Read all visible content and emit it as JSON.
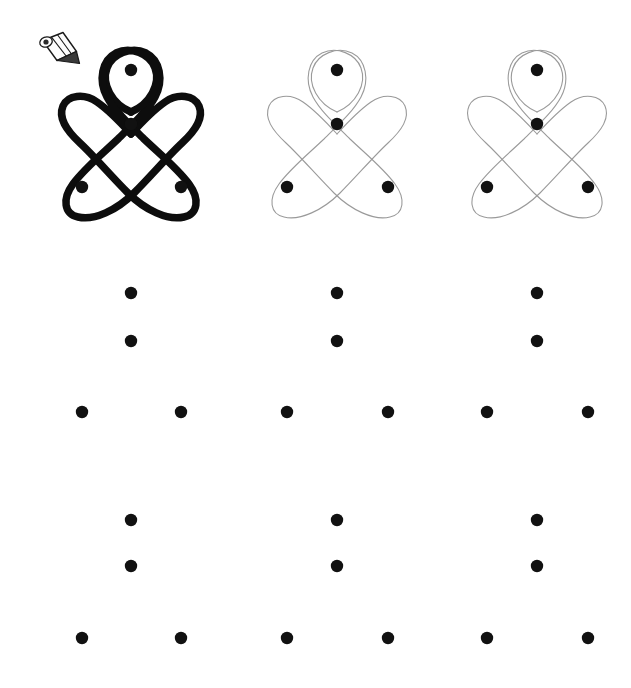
{
  "page": {
    "title": "Kolam dot-grid tracing worksheet",
    "background_color": "#ffffff",
    "width": 631,
    "height": 688
  },
  "icons": {
    "pencil": {
      "name": "pencil-icon",
      "x": 38,
      "y": 32,
      "width": 44,
      "height": 34,
      "color": "#1a1a1a"
    }
  },
  "colors": {
    "dot": "#111111",
    "stroke_bold": "#0d0d0d",
    "stroke_trace": "#9a9a9a"
  },
  "geometry": {
    "dot_radius": 6.2,
    "columns_x": [
      82,
      131,
      181,
      287,
      337,
      388,
      487,
      537,
      588
    ],
    "rows_y": [
      70,
      124,
      187,
      293,
      341,
      412,
      520,
      566,
      638
    ]
  },
  "chart_data": {
    "type": "scatter",
    "title": "Kolam dot-grid tracing worksheet",
    "xlabel": "",
    "ylabel": "",
    "xlim": [
      0,
      631
    ],
    "ylim": [
      688,
      0
    ],
    "grid": false,
    "legend": null,
    "series": [
      {
        "name": "group-1-dots",
        "values": [
          [
            131,
            70
          ],
          [
            131,
            124
          ],
          [
            82,
            187
          ],
          [
            181,
            187
          ]
        ]
      },
      {
        "name": "group-2-dots",
        "values": [
          [
            337,
            70
          ],
          [
            337,
            124
          ],
          [
            287,
            187
          ],
          [
            388,
            187
          ]
        ]
      },
      {
        "name": "group-3-dots",
        "values": [
          [
            537,
            70
          ],
          [
            537,
            124
          ],
          [
            487,
            187
          ],
          [
            588,
            187
          ]
        ]
      },
      {
        "name": "group-4-dots",
        "values": [
          [
            131,
            293
          ],
          [
            131,
            341
          ],
          [
            82,
            412
          ],
          [
            181,
            412
          ]
        ]
      },
      {
        "name": "group-5-dots",
        "values": [
          [
            337,
            293
          ],
          [
            337,
            341
          ],
          [
            287,
            412
          ],
          [
            388,
            412
          ]
        ]
      },
      {
        "name": "group-6-dots",
        "values": [
          [
            537,
            293
          ],
          [
            537,
            341
          ],
          [
            487,
            412
          ],
          [
            588,
            412
          ]
        ]
      },
      {
        "name": "group-7-dots",
        "values": [
          [
            131,
            520
          ],
          [
            131,
            566
          ],
          [
            82,
            638
          ],
          [
            181,
            638
          ]
        ]
      },
      {
        "name": "group-8-dots",
        "values": [
          [
            337,
            520
          ],
          [
            337,
            566
          ],
          [
            287,
            638
          ],
          [
            388,
            638
          ]
        ]
      },
      {
        "name": "group-9-dots",
        "values": [
          [
            537,
            520
          ],
          [
            537,
            566
          ],
          [
            487,
            638
          ],
          [
            588,
            638
          ]
        ]
      }
    ]
  },
  "figures": [
    {
      "id": "figure-1",
      "label": "Bold kolam example",
      "style": "bold",
      "stroke_color": "#0d0d0d",
      "stroke_width": 7.5,
      "origin_x": 0,
      "origin_y": 0,
      "has_curve": true
    },
    {
      "id": "figure-2",
      "label": "Light kolam trace",
      "style": "trace",
      "stroke_color": "#9a9a9a",
      "stroke_width": 1.1,
      "origin_x": 206,
      "origin_y": 0,
      "has_curve": true
    },
    {
      "id": "figure-3",
      "label": "Light kolam trace",
      "style": "trace",
      "stroke_color": "#9a9a9a",
      "stroke_width": 1.1,
      "origin_x": 406,
      "origin_y": 0,
      "has_curve": true
    },
    {
      "id": "figure-4",
      "label": "Blank practice dot grid",
      "style": "blank",
      "stroke_color": null,
      "stroke_width": 0,
      "origin_x": 0,
      "origin_y": 224,
      "has_curve": false
    },
    {
      "id": "figure-5",
      "label": "Blank practice dot grid",
      "style": "blank",
      "stroke_color": null,
      "stroke_width": 0,
      "origin_x": 206,
      "origin_y": 224,
      "has_curve": false
    },
    {
      "id": "figure-6",
      "label": "Blank practice dot grid",
      "style": "blank",
      "stroke_color": null,
      "stroke_width": 0,
      "origin_x": 406,
      "origin_y": 224,
      "has_curve": false
    },
    {
      "id": "figure-7",
      "label": "Blank practice dot grid",
      "style": "blank",
      "stroke_color": null,
      "stroke_width": 0,
      "origin_x": 0,
      "origin_y": 450,
      "has_curve": false
    },
    {
      "id": "figure-8",
      "label": "Blank practice dot grid",
      "style": "blank",
      "stroke_color": null,
      "stroke_width": 0,
      "origin_x": 206,
      "origin_y": 450,
      "has_curve": false
    },
    {
      "id": "figure-9",
      "label": "Blank practice dot grid",
      "style": "blank",
      "stroke_color": null,
      "stroke_width": 0,
      "origin_x": 406,
      "origin_y": 450,
      "has_curve": false
    }
  ]
}
